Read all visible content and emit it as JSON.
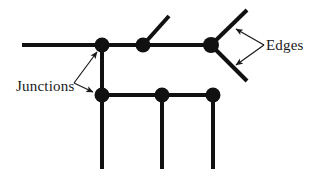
{
  "figure": {
    "type": "node-edge-diagram",
    "background_color": "#ffffff",
    "stroke_color": "#111111",
    "junction_fill_color": "#111111",
    "annotation_color": "#1a1a1a",
    "edge_stroke_width": 4,
    "annotation_stroke_width": 1.2,
    "junction_radius": 7.5
  },
  "labels": {
    "junctions": "Junctions",
    "edges": "Edges"
  },
  "graph": {
    "junctions": [
      {
        "id": "j-top-left",
        "x": 102,
        "y": 45
      },
      {
        "id": "j-top-mid",
        "x": 143,
        "y": 45
      },
      {
        "id": "j-top-right",
        "x": 211,
        "y": 45
      },
      {
        "id": "j-bottom-left",
        "x": 102,
        "y": 95
      },
      {
        "id": "j-bottom-mid",
        "x": 162,
        "y": 95
      },
      {
        "id": "j-bottom-right",
        "x": 213,
        "y": 95
      }
    ],
    "edges": [
      {
        "id": "edge-top-left-stub",
        "x1": 22,
        "y1": 45,
        "x2": 102,
        "y2": 45
      },
      {
        "id": "edge-top-left-to-mid",
        "x1": 102,
        "y1": 45,
        "x2": 143,
        "y2": 45
      },
      {
        "id": "edge-top-mid-to-right",
        "x1": 143,
        "y1": 45,
        "x2": 211,
        "y2": 45
      },
      {
        "id": "edge-top-mid-diagonal",
        "x1": 143,
        "y1": 45,
        "x2": 169,
        "y2": 16
      },
      {
        "id": "edge-top-right-up",
        "x1": 211,
        "y1": 45,
        "x2": 247,
        "y2": 10
      },
      {
        "id": "edge-top-right-down",
        "x1": 211,
        "y1": 45,
        "x2": 247,
        "y2": 81
      },
      {
        "id": "edge-left-vertical",
        "x1": 102,
        "y1": 45,
        "x2": 102,
        "y2": 95
      },
      {
        "id": "edge-bottom-left-to-mid",
        "x1": 102,
        "y1": 95,
        "x2": 162,
        "y2": 95
      },
      {
        "id": "edge-bottom-mid-to-right",
        "x1": 162,
        "y1": 95,
        "x2": 213,
        "y2": 95
      },
      {
        "id": "edge-leg-left",
        "x1": 102,
        "y1": 95,
        "x2": 102,
        "y2": 169
      },
      {
        "id": "edge-leg-mid",
        "x1": 162,
        "y1": 95,
        "x2": 162,
        "y2": 169
      },
      {
        "id": "edge-leg-right",
        "x1": 213,
        "y1": 95,
        "x2": 213,
        "y2": 169
      }
    ]
  },
  "annotations": {
    "junctions_label": {
      "text": "Junctions",
      "x": 16,
      "y": 91,
      "leaders": [
        {
          "id": "leader-junctions-upper",
          "x1": 74,
          "y1": 83,
          "x2": 97,
          "y2": 52
        },
        {
          "id": "leader-junctions-lower",
          "x1": 74,
          "y1": 83,
          "x2": 93,
          "y2": 92
        }
      ]
    },
    "edges_label": {
      "text": "Edges",
      "x": 266,
      "y": 50,
      "leaders": [
        {
          "id": "leader-edges-upper",
          "x1": 264,
          "y1": 45,
          "x2": 236,
          "y2": 29
        },
        {
          "id": "leader-edges-lower",
          "x1": 264,
          "y1": 45,
          "x2": 236,
          "y2": 65
        }
      ]
    }
  }
}
